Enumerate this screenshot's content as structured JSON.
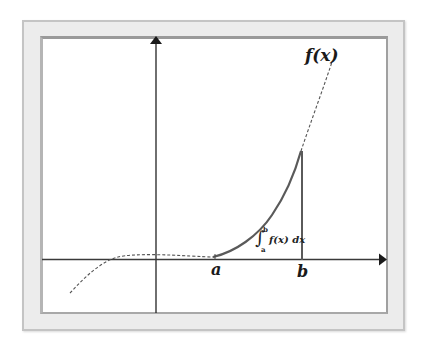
{
  "diagram": {
    "function_label": "f(x)",
    "lower_bound_label": "a",
    "upper_bound_label": "b",
    "integral": {
      "sign": "∫",
      "upper": "b",
      "lower": "a",
      "body": "f(x) dx"
    },
    "colors": {
      "frame_fill": "#ececec",
      "frame_border": "#c4c4c4",
      "inner_border": "#9a9a9a",
      "axis": "#222222",
      "curve_solid": "#5a5a5a",
      "curve_dashed": "#555555",
      "background": "#ffffff"
    },
    "elements": {
      "x_axis": "horizontal axis with arrow pointing right",
      "y_axis": "vertical axis with arrow pointing up",
      "dashed_curve": "cubic-like curve f(x) drawn dashed outside [a,b]",
      "solid_curve": "curve segment drawn solid from a to b",
      "bound_line_b": "vertical line at x=b from axis to curve"
    }
  }
}
